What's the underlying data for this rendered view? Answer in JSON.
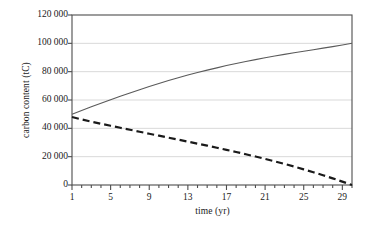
{
  "chart_data": {
    "type": "line",
    "title": "",
    "xlabel": "time (yr)",
    "ylabel": "carbon content (tC)",
    "xlim": [
      1,
      30
    ],
    "ylim": [
      0,
      120000
    ],
    "grid": true,
    "grid_axis": "y",
    "legend": "none",
    "x_major_ticks": [
      1,
      5,
      9,
      13,
      17,
      21,
      25,
      29
    ],
    "x_minor_tick_step": 1,
    "y_ticks": [
      0,
      20000,
      40000,
      60000,
      80000,
      100000,
      120000
    ],
    "y_tick_labels": [
      "0",
      "20 000",
      "40 000",
      "60 000",
      "80 000",
      "100 000",
      "120 000"
    ],
    "x": [
      1,
      2,
      3,
      4,
      5,
      6,
      7,
      8,
      9,
      10,
      11,
      12,
      13,
      14,
      15,
      16,
      17,
      18,
      19,
      20,
      21,
      22,
      23,
      24,
      25,
      26,
      27,
      28,
      29,
      30
    ],
    "series": [
      {
        "name": "accumulating carbon stock",
        "style": "solid",
        "color": "#5a5a5a",
        "width": 1.1,
        "values": [
          50000,
          52600,
          55200,
          57700,
          60200,
          62600,
          65000,
          67300,
          69500,
          71600,
          73700,
          75700,
          77600,
          79400,
          81100,
          82700,
          84300,
          85800,
          87200,
          88500,
          89800,
          91000,
          92200,
          93300,
          94400,
          95500,
          96600,
          97700,
          98800,
          100000
        ]
      },
      {
        "name": "declining carbon stock",
        "style": "dashed",
        "color": "#1a1a1a",
        "width": 2.2,
        "dash": [
          7,
          4
        ],
        "values": [
          48000,
          46300,
          44700,
          43200,
          41800,
          40400,
          39000,
          37600,
          36200,
          34800,
          33400,
          32000,
          30600,
          29200,
          27800,
          26300,
          24800,
          23300,
          21700,
          20100,
          18400,
          16700,
          14900,
          13000,
          11000,
          9000,
          6900,
          4700,
          2400,
          0
        ]
      }
    ],
    "axis": {
      "frame_color": "#4d4d4d",
      "grid_color": "#d9d9d9",
      "tick_color": "#4d4d4d"
    }
  }
}
